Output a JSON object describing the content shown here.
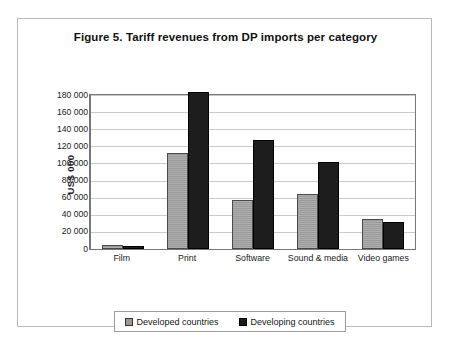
{
  "figure": {
    "title": "Figure 5. Tariff revenues from DP imports per category"
  },
  "axis": {
    "y_title": "US$ 000",
    "y_ticks": [
      "180 000",
      "160 000",
      "140 000",
      "120 000",
      "100 000",
      "80 000",
      "60 000",
      "40 000",
      "20 000",
      "0"
    ]
  },
  "legend": {
    "entries": [
      {
        "label": "Developed countries",
        "color": "#9a9a9a"
      },
      {
        "label": "Developing countries",
        "color": "#1d1d1d"
      }
    ]
  },
  "chart_data": {
    "type": "bar",
    "title": "Figure 5. Tariff revenues from DP imports per category",
    "xlabel": "",
    "ylabel": "US$ 000",
    "ylim": [
      0,
      180000
    ],
    "ytick_step": 20000,
    "grid": true,
    "legend_position": "bottom",
    "categories": [
      "Film",
      "Print",
      "Software",
      "Sound & media",
      "Video games"
    ],
    "series": [
      {
        "name": "Developed countries",
        "color": "#9a9a9a",
        "values": [
          5000,
          112000,
          57000,
          64000,
          35000
        ]
      },
      {
        "name": "Developing countries",
        "color": "#1d1d1d",
        "values": [
          4000,
          184000,
          128000,
          102000,
          31000
        ]
      }
    ]
  }
}
